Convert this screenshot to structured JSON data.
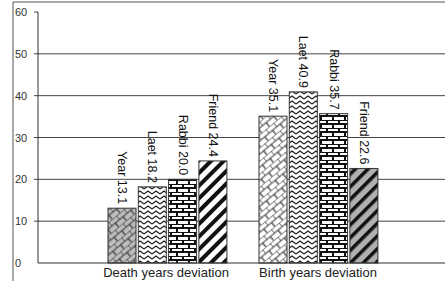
{
  "chart_data": {
    "type": "bar",
    "title": "",
    "xlabel": "",
    "ylabel": "",
    "ylim": [
      0,
      60
    ],
    "yticks": [
      0,
      10,
      20,
      30,
      40,
      50,
      60
    ],
    "grid": true,
    "legend": "none (series labels written vertically above each bar)",
    "categories": [
      "Death years deviation",
      "Birth years deviation"
    ],
    "series": [
      {
        "name": "Year",
        "values": [
          13.1,
          35.1
        ],
        "pattern": "gray-brick-diagonal / white-brick-diagonal"
      },
      {
        "name": "Laet",
        "values": [
          18.2,
          40.9
        ],
        "pattern": "zigzag"
      },
      {
        "name": "Rabbi",
        "values": [
          20.0,
          35.7
        ],
        "pattern": "brick"
      },
      {
        "name": "Friend",
        "values": [
          24.4,
          22.6
        ],
        "pattern": "diagonal-stripes"
      }
    ],
    "bar_labels": [
      [
        "Year 13.1",
        "Laet 18.2",
        "Rabbi 20.0",
        "Friend 24.4"
      ],
      [
        "Year 35.1",
        "Laet 40.9",
        "Rabbi 35.7",
        "Friend 22.6"
      ]
    ]
  },
  "colors": {
    "axis": "#333333",
    "grid": "#444444",
    "bar_outline": "#333333",
    "gray_fill": "#b8b8b8"
  }
}
